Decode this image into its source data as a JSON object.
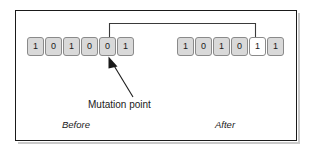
{
  "figure": {
    "frame_color": "#1a1a1a",
    "background": "#ffffff"
  },
  "before": {
    "caption": "Before",
    "bits": [
      "1",
      "0",
      "1",
      "0",
      "0",
      "1"
    ],
    "mutation_index": 4,
    "cell_fill": "#d9d9d9",
    "cell_border": "#8a8a8a"
  },
  "after": {
    "caption": "After",
    "bits": [
      "1",
      "0",
      "1",
      "0",
      "1",
      "1"
    ],
    "mutation_index": 4,
    "mutated_cell_fill": "#ffffff",
    "cell_fill": "#d9d9d9",
    "cell_border": "#8a8a8a"
  },
  "annotation": {
    "mutation_label": "Mutation point",
    "arrow_color": "#1a1a1a",
    "connector_color": "#3a3a3a"
  }
}
